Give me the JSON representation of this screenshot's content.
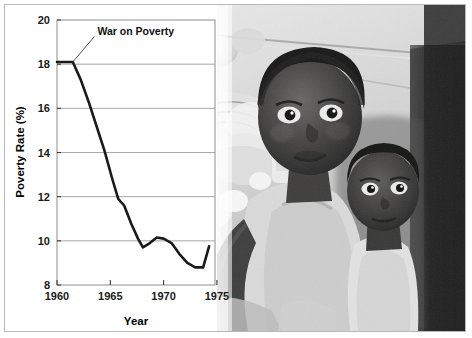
{
  "figure": {
    "background_color": "#ffffff",
    "border_color": "#b9b9b9"
  },
  "photo": {
    "description": "black-and-white photograph of two young children indoors",
    "alt": "Two children looking toward the camera in a cluttered room",
    "palette": [
      "#0d0d0d",
      "#3a3a3a",
      "#6d6d6d",
      "#a5a5a5",
      "#d8d8d8",
      "#f2f2f2"
    ]
  },
  "chart_data": {
    "type": "line",
    "title": "",
    "xlabel": "Year",
    "ylabel": "Poverty Rate (%)",
    "xlim": [
      1960,
      1976
    ],
    "ylim": [
      8,
      20
    ],
    "xticks": [
      1960,
      1965,
      1970,
      1975
    ],
    "xticklabels": [
      "1960",
      "1965",
      "1970",
      "1975"
    ],
    "yticks": [
      8,
      10,
      12,
      14,
      16,
      18,
      20
    ],
    "yticklabels": [
      "8",
      "10",
      "12",
      "14",
      "16",
      "18",
      "20"
    ],
    "grid": true,
    "grid_axis": "y",
    "legend": false,
    "line_color": "#1a1a1a",
    "line_width": 2.6,
    "x": [
      1960,
      1961,
      1961.6,
      1962.4,
      1963.2,
      1964,
      1964.8,
      1965.6,
      1966.2,
      1966.8,
      1967.5,
      1968.2,
      1968.7,
      1969.4,
      1970.1,
      1970.8,
      1971.6,
      1972.4,
      1973.2,
      1974.0,
      1974.8,
      1975.4
    ],
    "y": [
      18.1,
      18.1,
      18.1,
      17.3,
      16.3,
      15.2,
      14.1,
      12.8,
      11.9,
      11.6,
      10.8,
      10.1,
      9.7,
      9.9,
      10.15,
      10.1,
      9.9,
      9.4,
      9.0,
      8.8,
      8.8,
      9.75
    ],
    "annotations": [
      {
        "text": "War on Poverty",
        "points_to_x": 1961.6,
        "points_to_y": 18.1,
        "label_x": 1964.1,
        "label_y": 19.3
      }
    ]
  }
}
